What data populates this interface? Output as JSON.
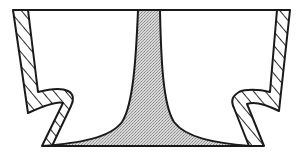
{
  "diagram": {
    "title": "",
    "colors": {
      "background": "#ffffff",
      "outline": "#1a1a1a",
      "stem_fill": "#c8c8c8",
      "hatch": "#2a2a2a"
    },
    "elements": [
      {
        "id": "top-line",
        "kind": "line",
        "label": ""
      },
      {
        "id": "central-stem",
        "kind": "stippled-region",
        "label": ""
      },
      {
        "id": "left-wall",
        "kind": "hatched-section",
        "label": ""
      },
      {
        "id": "right-wall",
        "kind": "hatched-section",
        "label": ""
      },
      {
        "id": "base-line",
        "kind": "line",
        "label": ""
      }
    ]
  }
}
